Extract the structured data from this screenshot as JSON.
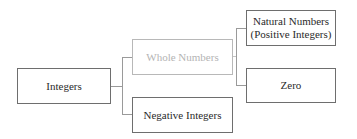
{
  "diagram": {
    "type": "tree",
    "root": {
      "label": "Integers",
      "children": [
        {
          "label": "Whole Numbers",
          "style": "faded",
          "children": [
            {
              "label_line1": "Natural Numbers",
              "label_line2": "(Positive Integers)"
            },
            {
              "label": "Zero"
            }
          ]
        },
        {
          "label": "Negative Integers"
        }
      ]
    },
    "colors": {
      "border": "#6e6e6e",
      "text": "#2a2a2a",
      "faded_border": "#b8b8b8",
      "faded_text": "#b4b4b4",
      "connector": "#9a9a9a"
    }
  }
}
